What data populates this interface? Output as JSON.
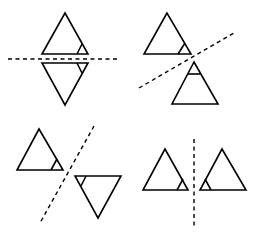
{
  "diagram": {
    "title": "",
    "colors": {
      "stroke": "#000000",
      "background": "#ffffff"
    },
    "panels": [
      {
        "id": "horizontal-reflection",
        "axis": {
          "orientation": "horizontal",
          "x1": 8,
          "y1": 59,
          "x2": 118,
          "y2": 59
        },
        "original": {
          "points": "65,13 42,54 88,54",
          "mark": "77,54 82,44"
        },
        "image": {
          "points": "42,63 88,63 65,105",
          "mark": "77,63 82,73"
        }
      },
      {
        "id": "diagonal-reflection-ascending",
        "axis": {
          "orientation": "diagonal",
          "x1": 139,
          "y1": 88,
          "x2": 234,
          "y2": 33
        },
        "original": {
          "points": "167,13 144,54 191,54",
          "mark": "178,54 185,43"
        },
        "image": {
          "points": "194,62 172,104 218,104",
          "mark": "188,74 200,74"
        }
      },
      {
        "id": "diagonal-reflection-steep",
        "axis": {
          "orientation": "diagonal",
          "x1": 94,
          "y1": 126,
          "x2": 40,
          "y2": 223
        },
        "original": {
          "points": "39,129 17,170 63,170",
          "mark": "51,170 57,159"
        },
        "image": {
          "points": "75,176 121,176 98,218",
          "mark": "86,176 81,186"
        }
      },
      {
        "id": "vertical-reflection",
        "axis": {
          "orientation": "vertical",
          "x1": 194,
          "y1": 139,
          "x2": 194,
          "y2": 229
        },
        "original": {
          "points": "165,149 143,190 188,190",
          "mark": "177,190 183,179"
        },
        "image": {
          "points": "222,149 200,190 246,190",
          "mark": "211,190 205,179"
        }
      }
    ]
  }
}
